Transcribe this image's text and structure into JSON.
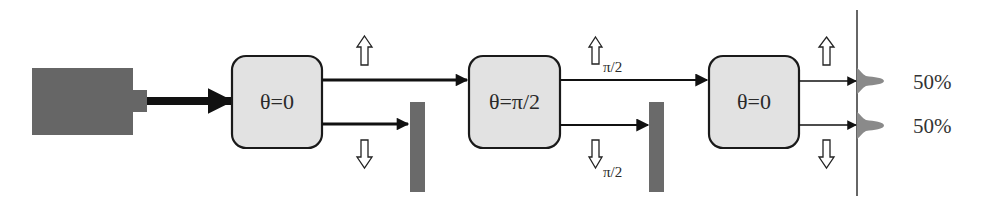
{
  "diagram": {
    "colors": {
      "source_fill": "#666666",
      "box_fill": "#e2e2e2",
      "box_stroke": "#1a1a1a",
      "beam": "#111111",
      "block_fill": "#6a6a6a",
      "peak_fill": "#8a8a8a",
      "screen_line": "#333333",
      "text": "#2a2a2a"
    },
    "source": {
      "label": ""
    },
    "stages": [
      {
        "id": "stage1",
        "label": "θ=0"
      },
      {
        "id": "stage2",
        "label": "θ=π/2"
      },
      {
        "id": "stage3",
        "label": "θ=0"
      }
    ],
    "polarization_markers": [
      {
        "id": "stage1-up",
        "direction": "up",
        "subscript": ""
      },
      {
        "id": "stage1-down",
        "direction": "down",
        "subscript": ""
      },
      {
        "id": "stage2-up",
        "direction": "up",
        "subscript": "π/2"
      },
      {
        "id": "stage2-down",
        "direction": "down",
        "subscript": "π/2"
      },
      {
        "id": "stage3-up",
        "direction": "up",
        "subscript": ""
      },
      {
        "id": "stage3-down",
        "direction": "down",
        "subscript": ""
      }
    ],
    "blocks": [
      {
        "id": "block1",
        "after_stage": "stage1",
        "path": "lower"
      },
      {
        "id": "block2",
        "after_stage": "stage2",
        "path": "lower"
      }
    ],
    "outputs": [
      {
        "id": "output-upper",
        "percent": "50%"
      },
      {
        "id": "output-lower",
        "percent": "50%"
      }
    ]
  }
}
